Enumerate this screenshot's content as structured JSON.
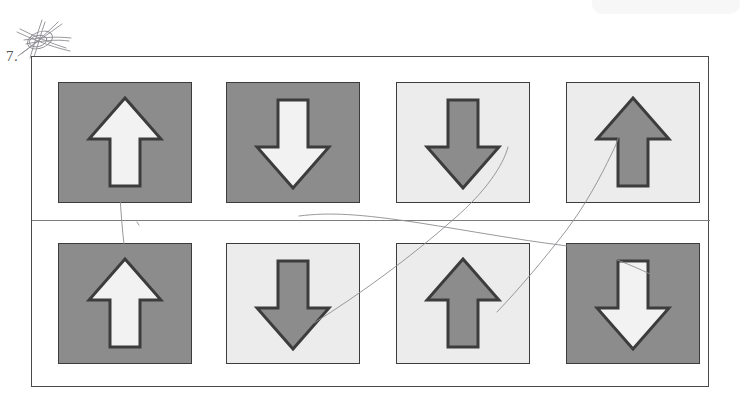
{
  "figure": {
    "number_label": "7.",
    "annotation_marks": [
      {
        "name": "star-scribble",
        "kind": "hand-drawn-star"
      },
      {
        "name": "pencil-line-vertical",
        "kind": "hand-drawn-line"
      },
      {
        "name": "pencil-line-diagonal-a",
        "kind": "hand-drawn-line"
      },
      {
        "name": "pencil-line-diagonal-b",
        "kind": "hand-drawn-line"
      },
      {
        "name": "pencil-line-shallow",
        "kind": "hand-drawn-line"
      }
    ]
  },
  "colors": {
    "dark_cell_background": "#8c8c8c",
    "light_cell_background": "#ececec",
    "light_arrow_fill": "#f2f2f2",
    "dark_arrow_fill": "#8c8c8c",
    "outline": "#3c3c3c",
    "frame_border": "#4a4a4a",
    "divider": "#7d7d7d",
    "pencil": "#8d8d93",
    "page_background": "#ffffff"
  },
  "grid": {
    "rows": 2,
    "columns": 4,
    "cells": [
      {
        "id": "cell-1",
        "row": 1,
        "column": 1,
        "direction": "up",
        "background": "dark",
        "arrow_fill": "light",
        "x": 26,
        "y": 25
      },
      {
        "id": "cell-2",
        "row": 1,
        "column": 2,
        "direction": "down",
        "background": "dark",
        "arrow_fill": "light",
        "x": 194,
        "y": 25
      },
      {
        "id": "cell-3",
        "row": 1,
        "column": 3,
        "direction": "down",
        "background": "light",
        "arrow_fill": "dark",
        "x": 364,
        "y": 25
      },
      {
        "id": "cell-4",
        "row": 1,
        "column": 4,
        "direction": "up",
        "background": "light",
        "arrow_fill": "dark",
        "x": 534,
        "y": 25
      },
      {
        "id": "cell-5",
        "row": 2,
        "column": 1,
        "direction": "up",
        "background": "dark",
        "arrow_fill": "light",
        "x": 26,
        "y": 186
      },
      {
        "id": "cell-6",
        "row": 2,
        "column": 2,
        "direction": "down",
        "background": "light",
        "arrow_fill": "dark",
        "x": 194,
        "y": 186
      },
      {
        "id": "cell-7",
        "row": 2,
        "column": 3,
        "direction": "up",
        "background": "light",
        "arrow_fill": "dark",
        "x": 364,
        "y": 186
      },
      {
        "id": "cell-8",
        "row": 2,
        "column": 4,
        "direction": "down",
        "background": "dark",
        "arrow_fill": "light",
        "x": 534,
        "y": 186
      }
    ]
  }
}
